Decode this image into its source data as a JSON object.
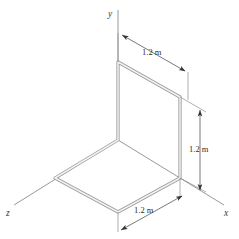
{
  "figure": {
    "type": "technical-diagram",
    "background_color": "#ffffff",
    "wire_color": "#9a9a9a",
    "axis_color": "#8c8c8c",
    "dimension_color": "#333333"
  },
  "axes": [
    {
      "id": "y",
      "label": "y",
      "direction": "up"
    },
    {
      "id": "x",
      "label": "x",
      "direction": "lower-right"
    },
    {
      "id": "z",
      "label": "z",
      "direction": "lower-left"
    }
  ],
  "dimensions": [
    {
      "id": "top-depth",
      "label": "1.2 m",
      "orientation": "diagonal-upper",
      "describes": "top edge of vertical square face"
    },
    {
      "id": "right-height",
      "label": "1.2 m",
      "orientation": "vertical",
      "describes": "height of vertical square face"
    },
    {
      "id": "bottom-width",
      "label": "1.2 m",
      "orientation": "diagonal-lower",
      "describes": "front edge of horizontal square face"
    }
  ],
  "geometry": {
    "shape": "two 1.2 m squares joined at a common edge",
    "vertical_face_plane": "y-z",
    "horizontal_face_plane": "x-z",
    "side_length": "1.2 m"
  }
}
